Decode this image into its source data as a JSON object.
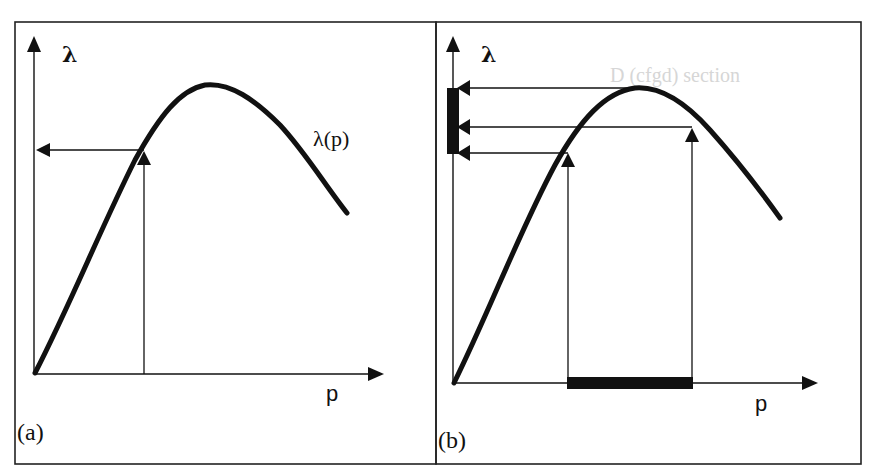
{
  "figure": {
    "panels": [
      {
        "id": "a",
        "label": "(a)",
        "y_axis_label": "λ",
        "x_axis_label": "p",
        "curve_label": "λ(p)",
        "description": "Single value of p mapped through curve λ(p) to a single λ value on the vertical axis"
      },
      {
        "id": "b",
        "label": "(b)",
        "y_axis_label": "λ",
        "x_axis_label": "p",
        "description": "Interval of p (thick bar on x-axis) mapped through curve to an interval of λ (thick bar on y-axis), including the curve peak"
      }
    ],
    "background_bleedthrough_fragment": "D (cfgd) section",
    "colors": {
      "ink": "#111111",
      "frame": "#222222",
      "background": "#ffffff",
      "bleedthrough": "#d6d6d6"
    }
  }
}
